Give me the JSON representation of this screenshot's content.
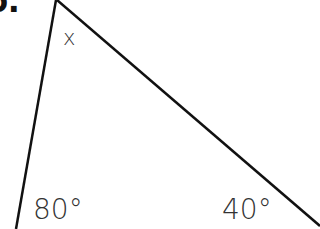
{
  "question": {
    "number_fragment": "6."
  },
  "triangle": {
    "apex_label": "x",
    "left_angle_label": "80°",
    "right_angle_label": "40°",
    "line_color": "#111111"
  }
}
